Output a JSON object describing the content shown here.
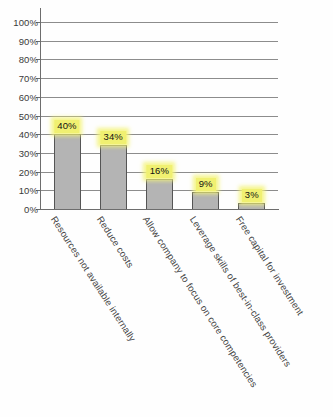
{
  "chart_data": {
    "type": "bar",
    "title": "",
    "xlabel": "",
    "ylabel": "",
    "categories": [
      "Resources not available internally",
      "Reduce costs",
      "Allow company to focus on core competencies",
      "Leverage skills of best-in-class providers",
      "Free capital for investment"
    ],
    "values": [
      40,
      34,
      16,
      9,
      3
    ],
    "value_labels": [
      "40%",
      "34%",
      "16%",
      "9%",
      "3%"
    ],
    "ylim": [
      0,
      100
    ],
    "ytick_values": [
      0,
      10,
      20,
      30,
      40,
      50,
      60,
      70,
      80,
      90,
      100
    ],
    "ytick_labels": [
      "0%",
      "10%",
      "20%",
      "30%",
      "40%",
      "50%",
      "60%",
      "70%",
      "80%",
      "90%",
      "100%"
    ],
    "grid": true,
    "legend": false,
    "legend_position": "none",
    "colors": {
      "bar_fill": "#b4b4b4",
      "bar_border": "#555555",
      "label_highlight": "#f0f071",
      "gridline": "#8c8c8c",
      "axis": "#6d6d6d",
      "text": "#3a3a3a",
      "background": "#fefefe"
    }
  }
}
